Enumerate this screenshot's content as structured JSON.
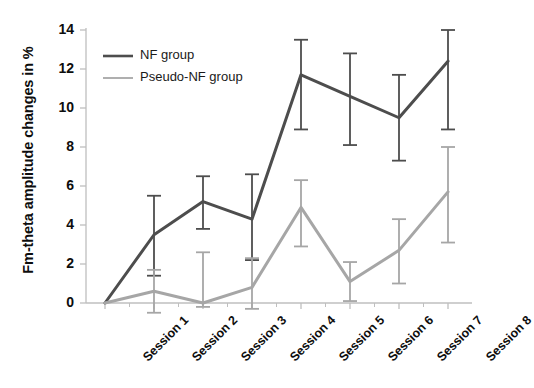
{
  "chart_data": {
    "type": "line",
    "title": "",
    "xlabel": "",
    "ylabel": "Fm-theta amplitude changes in %",
    "categories": [
      "Session 1",
      "Session 2",
      "Session 3",
      "Session 4",
      "Session 5",
      "Session 6",
      "Session 7",
      "Session 8"
    ],
    "ylim": [
      0,
      14
    ],
    "yticks": [
      0,
      2,
      4,
      6,
      8,
      10,
      12,
      14
    ],
    "grid": false,
    "legend_position": "top-left",
    "series": [
      {
        "name": "NF group",
        "color": "#4d4d4d",
        "values": [
          0,
          3.5,
          5.2,
          4.3,
          11.7,
          10.6,
          9.5,
          12.4
        ],
        "err_low": [
          0,
          1.4,
          3.8,
          2.2,
          8.9,
          8.1,
          7.3,
          8.9
        ],
        "err_high": [
          0,
          5.5,
          6.5,
          6.6,
          13.5,
          12.8,
          11.7,
          14.0
        ]
      },
      {
        "name": "Pseudo-NF group",
        "color": "#a6a6a6",
        "values": [
          0,
          0.6,
          0.0,
          0.8,
          4.9,
          1.1,
          2.7,
          5.7
        ],
        "err_low": [
          0,
          -0.5,
          -0.2,
          -0.3,
          2.9,
          0.1,
          1.0,
          3.1
        ],
        "err_high": [
          0,
          1.7,
          2.6,
          2.3,
          6.3,
          2.1,
          4.3,
          8.0
        ]
      }
    ]
  },
  "legend": {
    "items": [
      {
        "label": "NF group",
        "color": "#4d4d4d"
      },
      {
        "label": "Pseudo-NF group",
        "color": "#a6a6a6"
      }
    ]
  },
  "axis": {
    "color": "#bfbfbf",
    "tick_color": "#bfbfbf"
  }
}
